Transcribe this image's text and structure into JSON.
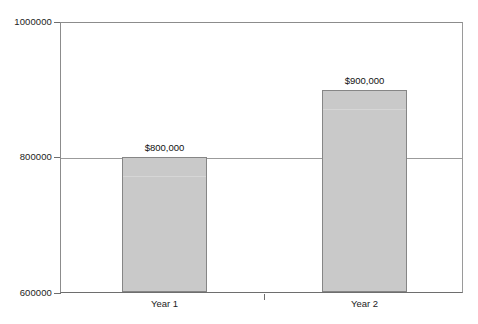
{
  "chart_data": {
    "type": "bar",
    "title": "",
    "subtitle": "",
    "xlabel": "",
    "ylabel": "",
    "categories": [
      "Year 1",
      "Year 2"
    ],
    "values": [
      800000,
      900000
    ],
    "data_labels": [
      "$800,000",
      "$900,000"
    ],
    "ylim": [
      600000,
      1000000
    ],
    "ytick_labels": [
      "1000000",
      "800000",
      "600000"
    ],
    "ytick_values": [
      1000000,
      800000,
      600000
    ],
    "grid": "horizontal-at-800000",
    "legend": "none",
    "bar_color": "#c9c9c9",
    "bar_border_color": "#868686",
    "axis_color": "#6e6e6e",
    "gridline_color": "#9b9b9b",
    "background_color": "#ffffff",
    "text_color": "#1c1c1c"
  },
  "axis": {
    "y": {
      "ticks": [
        {
          "label": "1000000",
          "value": 1000000
        },
        {
          "label": "800000",
          "value": 800000
        },
        {
          "label": "600000",
          "value": 600000
        }
      ]
    },
    "x": {
      "ticks": [
        {
          "label": "Year 1"
        },
        {
          "label": "Year 2"
        }
      ]
    }
  },
  "bars": [
    {
      "category": "Year 1",
      "value": 800000,
      "label": "$800,000"
    },
    {
      "category": "Year 2",
      "value": 900000,
      "label": "$900,000"
    }
  ]
}
